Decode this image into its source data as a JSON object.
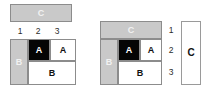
{
  "figure": {
    "title": "",
    "background_color": "#ffffff",
    "palette": {
      "gray_fill": "#c9c9c9",
      "gray_text": "#f2f2f2",
      "black_fill": "#050505",
      "white_fill": "#ffffff",
      "border": "#8c8c8c",
      "label_text": "#2b2b2b"
    }
  },
  "left_panel": {
    "name": "left-diagram",
    "c_box": {
      "label": "C",
      "style": "gray"
    },
    "column_ticks": [
      "1",
      "2",
      "3"
    ],
    "grid": {
      "b_column": {
        "label": "B",
        "style": "gray"
      },
      "a_black": {
        "label": "A",
        "style": "black"
      },
      "a_white": {
        "label": "A",
        "style": "white"
      },
      "b_row": {
        "label": "B",
        "style": "white"
      }
    }
  },
  "right_panel": {
    "name": "right-diagram",
    "c_header": {
      "label": "C",
      "style": "gray"
    },
    "grid": {
      "b_column": {
        "label": "B",
        "style": "gray"
      },
      "a_black": {
        "label": "A",
        "style": "black"
      },
      "a_white": {
        "label": "A",
        "style": "white"
      },
      "b_row": {
        "label": "B",
        "style": "white"
      }
    },
    "row_ticks": [
      "1",
      "2",
      "3"
    ],
    "c_box": {
      "label": "C",
      "style": "outline"
    }
  }
}
